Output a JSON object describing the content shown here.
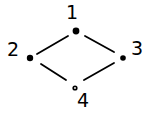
{
  "diagram": {
    "type": "hasse-diagram",
    "stroke_color": "#000000",
    "background": "#ffffff",
    "nodes": [
      {
        "id": "1",
        "label": "1",
        "x": 76,
        "y": 31,
        "lx": 66,
        "ly": 19,
        "filled": true,
        "r": 3.4
      },
      {
        "id": "2",
        "label": "2",
        "x": 30,
        "y": 58,
        "lx": 7,
        "ly": 56,
        "filled": true,
        "r": 3.2
      },
      {
        "id": "3",
        "label": "3",
        "x": 123,
        "y": 58,
        "lx": 131,
        "ly": 55,
        "filled": true,
        "r": 2.8
      },
      {
        "id": "4",
        "label": "4",
        "x": 75,
        "y": 88,
        "lx": 77,
        "ly": 107,
        "filled": false,
        "r": 2.6
      }
    ],
    "edges": [
      {
        "from": "1",
        "to": "2",
        "x1": 68,
        "y1": 36,
        "x2": 37,
        "y2": 54
      },
      {
        "from": "1",
        "to": "3",
        "x1": 85,
        "y1": 36,
        "x2": 114,
        "y2": 52
      },
      {
        "from": "2",
        "to": "4",
        "x1": 41,
        "y1": 64,
        "x2": 66,
        "y2": 80
      },
      {
        "from": "3",
        "to": "4",
        "x1": 114,
        "y1": 63,
        "x2": 84,
        "y2": 80
      }
    ]
  }
}
